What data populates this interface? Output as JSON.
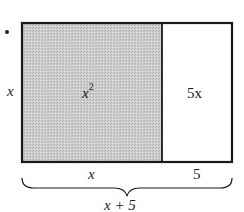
{
  "diagram": {
    "colors": {
      "shaded": "#c8c8c8",
      "stroke": "#1a1a1a",
      "unshaded": "#ffffff"
    },
    "left_side_label": "x",
    "regions": [
      {
        "label_base": "x",
        "label_exp": "2",
        "shaded": true
      },
      {
        "label": "5x",
        "shaded": false
      }
    ],
    "bottom_labels": [
      "x",
      "5"
    ],
    "total_label": "x + 5"
  }
}
